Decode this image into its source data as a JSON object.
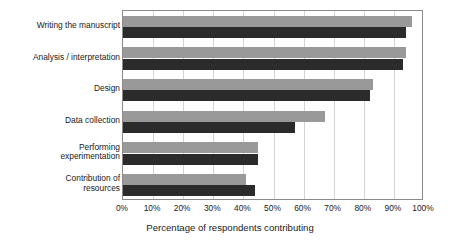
{
  "chart_data": {
    "type": "bar",
    "orientation": "horizontal",
    "title": "",
    "xlabel": "Percentage of respondents contributing",
    "ylabel": "",
    "xlim": [
      0,
      100
    ],
    "xticks": [
      "0%",
      "10%",
      "20%",
      "30%",
      "40%",
      "50%",
      "60%",
      "70%",
      "80%",
      "90%",
      "100%"
    ],
    "xtick_values": [
      0,
      10,
      20,
      30,
      40,
      50,
      60,
      70,
      80,
      90,
      100
    ],
    "grid": true,
    "legend": "none",
    "categories": [
      "Writing the manuscript",
      "Analysis / interpretation",
      "Design",
      "Data collection",
      "Performing\nexperimentation",
      "Contribution of\nresources"
    ],
    "series": [
      {
        "name": "series-1",
        "color": "#999999",
        "values": [
          96,
          94,
          83,
          67,
          45,
          41
        ]
      },
      {
        "name": "series-2",
        "color": "#2b2b2b",
        "values": [
          94,
          93,
          82,
          57,
          45,
          44
        ]
      }
    ]
  }
}
